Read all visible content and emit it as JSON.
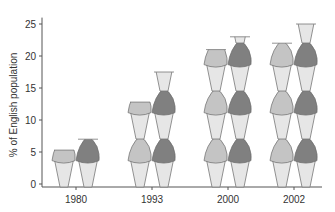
{
  "chart_data": {
    "type": "bar",
    "subtype": "pictogram (stacked ice-cream cones)",
    "title": "",
    "xlabel": "",
    "ylabel": "% of English population",
    "categories": [
      "1980",
      "1993",
      "2000",
      "2002"
    ],
    "series": [
      {
        "name": "Series A (light grey)",
        "color": "#c4c4c4",
        "values": [
          5.3,
          12.8,
          21,
          22
        ]
      },
      {
        "name": "Series B (dark grey)",
        "color": "#808080",
        "values": [
          7,
          17.5,
          23,
          25
        ]
      }
    ],
    "ylim": [
      0,
      26
    ],
    "yticks": [
      0,
      5,
      10,
      15,
      20,
      25
    ],
    "grid": false,
    "legend": "none"
  },
  "colors": {
    "axis": "#555555",
    "cone": "#e6e6e6",
    "cone_stroke": "#777777",
    "light_scoop": "#c4c4c4",
    "dark_scoop": "#808080"
  }
}
